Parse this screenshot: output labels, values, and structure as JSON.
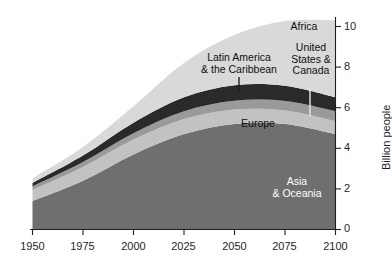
{
  "chart_data": {
    "type": "area",
    "title": "",
    "subtitle": "",
    "xlabel": "",
    "ylabel": "Billion people",
    "x": [
      1950,
      1975,
      2000,
      2025,
      2050,
      2075,
      2100
    ],
    "xlim": [
      1950,
      2100
    ],
    "ylim": [
      0,
      10.4
    ],
    "xticks": [
      "1950",
      "1975",
      "2000",
      "2025",
      "2050",
      "2075",
      "2100"
    ],
    "yticks": [
      "0",
      "2",
      "4",
      "6",
      "8",
      "10"
    ],
    "ytick_values": [
      0,
      2,
      4,
      6,
      8,
      10
    ],
    "grid": false,
    "legend": "inline-annotations",
    "stacked": true,
    "stack_order_bottom_to_top": [
      "Asia & Oceania",
      "Europe",
      "United States & Canada",
      "Latin America & the Caribbean",
      "Africa"
    ],
    "series": [
      {
        "name": "Asia & Oceania",
        "color": "#6f6f6f",
        "values": [
          1.4,
          2.4,
          3.7,
          4.7,
          5.2,
          5.2,
          4.7
        ]
      },
      {
        "name": "Europe",
        "color": "#c2c2c2",
        "values": [
          0.55,
          0.68,
          0.73,
          0.74,
          0.71,
          0.66,
          0.63
        ]
      },
      {
        "name": "United States & Canada",
        "color": "#9a9a9a",
        "values": [
          0.17,
          0.24,
          0.31,
          0.38,
          0.43,
          0.47,
          0.5
        ]
      },
      {
        "name": "Latin America & the Caribbean",
        "color": "#2a2a2a",
        "values": [
          0.17,
          0.32,
          0.52,
          0.69,
          0.76,
          0.75,
          0.68
        ]
      },
      {
        "name": "Africa",
        "color": "#d9d9d9",
        "values": [
          0.23,
          0.42,
          0.81,
          1.69,
          2.49,
          3.19,
          3.79
        ]
      }
    ],
    "annotations": [
      {
        "text": "Africa",
        "series": "Africa",
        "has_leader_line": false
      },
      {
        "text": "Latin America\n& the Caribbean",
        "series": "Latin America & the Caribbean",
        "has_leader_line": true
      },
      {
        "text": "United\nStates &\nCanada",
        "series": "United States & Canada",
        "has_leader_line": true
      },
      {
        "text": "Europe",
        "series": "Europe",
        "has_leader_line": false
      },
      {
        "text": "Asia\n& Oceania",
        "series": "Asia & Oceania",
        "has_leader_line": false
      }
    ]
  },
  "labels": {
    "africa": "Africa",
    "latin_america_line1": "Latin America",
    "latin_america_line2": "& the Caribbean",
    "united_states_line1": "United",
    "united_states_line2": "States &",
    "united_states_line3": "Canada",
    "europe": "Europe",
    "asia_line1": "Asia",
    "asia_line2": "& Oceania",
    "y_axis_title": "Billion people"
  },
  "axis": {
    "x_ticks": [
      "1950",
      "1975",
      "2000",
      "2025",
      "2050",
      "2075",
      "2100"
    ],
    "y_ticks": [
      "10",
      "8",
      "6",
      "4",
      "2",
      "0"
    ]
  },
  "colors": {
    "africa": "#d9d9d9",
    "latin_america": "#2a2a2a",
    "united_states": "#9a9a9a",
    "europe": "#c2c2c2",
    "asia": "#6f6f6f",
    "axis": "#1f1f1f",
    "background": "#ffffff"
  }
}
